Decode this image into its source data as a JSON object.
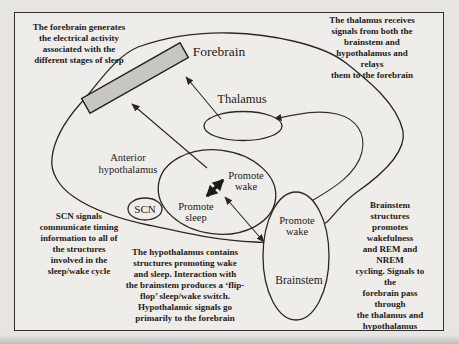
{
  "figure": {
    "labels": {
      "forebrain": "Forebrain",
      "thalamus": "Thalamus",
      "anterior_hypothalamus": "Anterior\nhypothalamus",
      "scn": "SCN",
      "hypo_promote_wake": "Promote\nwake",
      "hypo_promote_sleep": "Promote\nsleep",
      "brainstem_promote_wake": "Promote\nwake",
      "brainstem": "Brainstem"
    },
    "annotations": {
      "forebrain_note": "The forebrain generates\nthe electrical activity\nassociated with the\ndifferent stages of sleep",
      "thalamus_note": "The thalamus receives\nsignals from both the\nbrainstem and\nhypothalamus and relays\nthem to the forebrain",
      "scn_note": "SCN signals\ncommunicate timing\ninformation to all of\nthe structures\ninvolved in the\nsleep/wake cycle",
      "hypothalamus_note": "The hypothalamus contains\nstructures promoting wake\nand sleep. Interaction with\nthe brainstem produces a ‘flip-\nflop’ sleep/wake switch.\nHypothalamic signals go\nprimarily to the forebrain",
      "brainstem_note": "Brainstem structures\npromotes wakefulness\nand REM and NREM\ncycling. Signals to the\nforebrain pass through\nthe thalamus and\nhypothalamus"
    },
    "colors": {
      "paper": "#efede9",
      "page_background": "#e7e5e1",
      "ink": "#2a2724",
      "forebrain_fill": "#c8c6c1"
    }
  }
}
